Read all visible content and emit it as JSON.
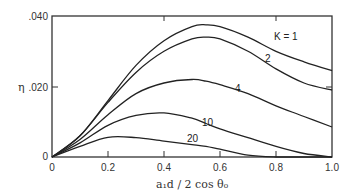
{
  "chart_data": {
    "type": "line",
    "title": "",
    "xlabel": "a₁d / 2 cos θ₀",
    "ylabel": "η",
    "xlim": [
      0,
      1.0
    ],
    "ylim": [
      0,
      0.04
    ],
    "grid": false,
    "x_ticks": [
      "0",
      "0.2",
      "0.4",
      "0.6",
      "0.8",
      "1.0"
    ],
    "y_ticks": [
      "0",
      ".020",
      ".040"
    ],
    "x": [
      0,
      0.1,
      0.2,
      0.3,
      0.4,
      0.5,
      0.55,
      0.6,
      0.7,
      0.8,
      0.9,
      1.0
    ],
    "series": [
      {
        "name": "K = 1",
        "label": "K = 1",
        "values": [
          0,
          0.006,
          0.016,
          0.026,
          0.033,
          0.037,
          0.0375,
          0.037,
          0.034,
          0.03,
          0.027,
          0.0245
        ]
      },
      {
        "name": "K = 2",
        "label": "2",
        "values": [
          0,
          0.006,
          0.0155,
          0.024,
          0.03,
          0.0335,
          0.034,
          0.0335,
          0.03,
          0.025,
          0.021,
          0.019
        ]
      },
      {
        "name": "K = 4",
        "label": "4",
        "values": [
          0,
          0.005,
          0.012,
          0.018,
          0.021,
          0.022,
          0.0215,
          0.0205,
          0.018,
          0.0145,
          0.0115,
          0.0085
        ]
      },
      {
        "name": "K = 10",
        "label": "10",
        "values": [
          0,
          0.004,
          0.009,
          0.0118,
          0.0125,
          0.011,
          0.0095,
          0.008,
          0.0055,
          0.003,
          0.001,
          0.0
        ]
      },
      {
        "name": "K = 20",
        "label": "20",
        "values": [
          0,
          0.003,
          0.0056,
          0.0055,
          0.0045,
          0.0035,
          0.003,
          0.0022,
          0.0005,
          0.0,
          0.0,
          0.0
        ]
      }
    ],
    "legend_position": "inline labels"
  },
  "axes": {
    "y_symbol": "η",
    "x_title": "a₁d / 2 cos θ₀"
  }
}
